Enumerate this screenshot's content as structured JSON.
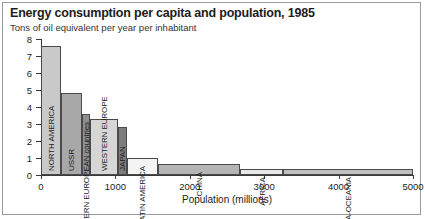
{
  "header": {
    "title": "Energy consumption per capita and population, 1985",
    "subtitle": "Tons of oil equivalent per year per inhabitant"
  },
  "chart_data": {
    "type": "bar",
    "title": "Energy consumption per capita and population, 1985",
    "subtitle": "Tons of oil equivalent per year per inhabitant",
    "xlabel": "Population (millions)",
    "ylabel": "Tons of oil equivalent per year per inhabitant",
    "xlim": [
      0,
      5000
    ],
    "ylim": [
      0,
      8
    ],
    "grid": false,
    "legend": "none",
    "note": "Variable-width bar chart (Marimekko style): bar width = population in millions, bar height = tons of oil equivalent per capita.",
    "xticks": [
      "0",
      "1000",
      "2000",
      "3000",
      "4000",
      "5000"
    ],
    "xtick_values": [
      0,
      1000,
      2000,
      3000,
      4000,
      5000
    ],
    "yticks": [
      "0",
      "1",
      "2",
      "3",
      "4",
      "5",
      "6",
      "7",
      "8"
    ],
    "ytick_values": [
      0,
      1,
      2,
      3,
      4,
      5,
      6,
      7,
      8
    ],
    "categories": [
      "NORTH AMERICA",
      "USSR",
      "Other EASTERN EUROPEAN countries",
      "WESTERN EUROPE",
      "JAPAN",
      "LATIN AMERICA",
      "CHINA",
      "AFRICA",
      "ASIA-OCEANIA"
    ],
    "bars": [
      {
        "label": "NORTH AMERICA",
        "height": 7.6,
        "pop_start": 0,
        "pop_end": 265,
        "width": 265,
        "color": "#c9c9c9",
        "label_inside": true
      },
      {
        "label": "USSR",
        "height": 4.8,
        "pop_start": 265,
        "pop_end": 545,
        "width": 280,
        "color": "#a8a8a8",
        "label_inside": true
      },
      {
        "label": "Other EASTERN EUROPEAN countries",
        "height": 3.6,
        "pop_start": 545,
        "pop_end": 655,
        "width": 110,
        "color": "#8f8f8f",
        "label_inside": false
      },
      {
        "label": "WESTERN EUROPE",
        "height": 3.3,
        "pop_start": 655,
        "pop_end": 1030,
        "width": 375,
        "color": "#d6d6d6",
        "label_inside": true
      },
      {
        "label": "JAPAN",
        "height": 2.8,
        "pop_start": 1030,
        "pop_end": 1150,
        "width": 120,
        "color": "#7d7d7d",
        "label_inside": true
      },
      {
        "label": "LATIN AMERICA",
        "height": 1.0,
        "pop_start": 1150,
        "pop_end": 1570,
        "width": 420,
        "color": "#f4f4f4",
        "label_inside": false
      },
      {
        "label": "CHINA",
        "height": 0.62,
        "pop_start": 1570,
        "pop_end": 2680,
        "width": 1110,
        "color": "#b5b5b5",
        "label_inside": false
      },
      {
        "label": "AFRICA",
        "height": 0.33,
        "pop_start": 2680,
        "pop_end": 3250,
        "width": 570,
        "color": "#e8e8e8",
        "label_inside": false
      },
      {
        "label": "ASIA-OCEANIA",
        "height": 0.33,
        "pop_start": 3250,
        "pop_end": 5000,
        "width": 1750,
        "color": "#bfbfbf",
        "label_inside": false
      }
    ]
  }
}
